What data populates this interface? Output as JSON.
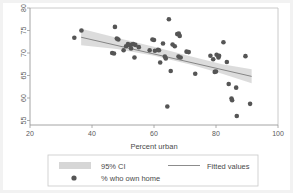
{
  "chart_data": {
    "type": "scatter",
    "title": "",
    "subtitle": "",
    "xlabel": "Percent urban",
    "ylabel": "",
    "xlim": [
      20,
      100
    ],
    "ylim": [
      54,
      80
    ],
    "xticks": [
      20,
      40,
      60,
      80,
      100
    ],
    "yticks": [
      55,
      60,
      65,
      70,
      75,
      80
    ],
    "xtick_labels": [
      "20",
      "40",
      "60",
      "80",
      "100"
    ],
    "ytick_labels": [
      "55",
      "60",
      "65",
      "70",
      "75",
      "80"
    ],
    "grid": false,
    "legend_position": "bottom",
    "series": [
      {
        "name": "% who own home",
        "type": "scatter",
        "marker": "circle",
        "color": "#555555",
        "points": [
          [
            34.3,
            73.4
          ],
          [
            36.6,
            75.0
          ],
          [
            46.5,
            70.0
          ],
          [
            47.1,
            69.9
          ],
          [
            47.4,
            75.8
          ],
          [
            48.0,
            73.2
          ],
          [
            48.5,
            73.0
          ],
          [
            50.2,
            70.6
          ],
          [
            51.0,
            71.5
          ],
          [
            51.6,
            72.0
          ],
          [
            52.2,
            71.7
          ],
          [
            52.6,
            71.0
          ],
          [
            52.8,
            71.9
          ],
          [
            53.3,
            72.0
          ],
          [
            53.7,
            69.0
          ],
          [
            54.0,
            71.8
          ],
          [
            55.1,
            71.3
          ],
          [
            58.6,
            70.6
          ],
          [
            59.5,
            73.0
          ],
          [
            60.0,
            72.9
          ],
          [
            60.3,
            70.5
          ],
          [
            61.3,
            70.7
          ],
          [
            61.6,
            70.6
          ],
          [
            62.0,
            67.9
          ],
          [
            62.9,
            72.1
          ],
          [
            63.5,
            69.2
          ],
          [
            63.8,
            68.8
          ],
          [
            64.3,
            58.1
          ],
          [
            64.8,
            77.5
          ],
          [
            65.4,
            66.0
          ],
          [
            66.0,
            71.9
          ],
          [
            66.7,
            71.5
          ],
          [
            67.5,
            74.2
          ],
          [
            67.9,
            69.2
          ],
          [
            68.0,
            74.3
          ],
          [
            68.3,
            73.8
          ],
          [
            68.6,
            69.0
          ],
          [
            70.5,
            70.3
          ],
          [
            71.2,
            70.2
          ],
          [
            73.3,
            65.4
          ],
          [
            78.2,
            69.4
          ],
          [
            79.1,
            68.6
          ],
          [
            79.6,
            65.8
          ],
          [
            80.0,
            65.9
          ],
          [
            80.2,
            69.6
          ],
          [
            80.8,
            69.0
          ],
          [
            81.0,
            69.4
          ],
          [
            82.4,
            72.4
          ],
          [
            83.5,
            68.0
          ],
          [
            84.1,
            63.1
          ],
          [
            85.0,
            59.9
          ],
          [
            85.2,
            59.5
          ],
          [
            86.5,
            62.3
          ],
          [
            86.7,
            56.0
          ],
          [
            89.5,
            69.3
          ],
          [
            91.0,
            58.7
          ]
        ]
      },
      {
        "name": "Fitted values",
        "type": "line",
        "color": "#6e6e6e",
        "x": [
          36.5,
          91.5
        ],
        "y": [
          73.5,
          64.8
        ]
      },
      {
        "name": "95% CI",
        "type": "band",
        "color": "#d6d6d6",
        "x": [
          36.5,
          48.0,
          60.0,
          72.0,
          82.0,
          91.5
        ],
        "upper": [
          75.4,
          73.4,
          71.4,
          69.2,
          67.5,
          66.4
        ],
        "lower": [
          71.7,
          70.9,
          69.4,
          67.4,
          65.4,
          63.3
        ]
      }
    ]
  },
  "legend": {
    "entries": [
      {
        "label": "95% CI",
        "marker": "band-swatch"
      },
      {
        "label": "Fitted values",
        "marker": "line-swatch"
      },
      {
        "label": "% who own home",
        "marker": "dot-swatch"
      }
    ]
  }
}
